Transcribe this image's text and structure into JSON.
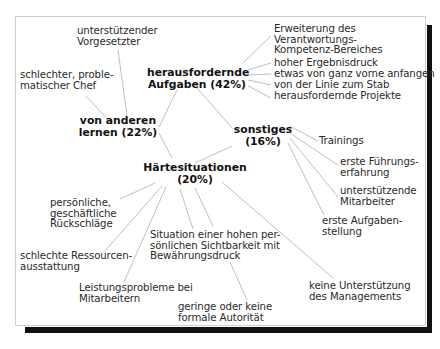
{
  "diagram": {
    "hubs": {
      "learning": "von anderen\nlernen (22%)",
      "challenging": "herausfordernde\nAufgaben (42%)",
      "other": "sonstiges\n(16%)",
      "hardship": "Härtesituationen\n(20%)"
    },
    "learning_items": [
      "unterstützender\nVorgesetzter",
      "schlechter, proble-\nmatischer Chef"
    ],
    "challenging_items": [
      "Erweiterung des\nVerantwortungs-\nKompetenz-Bereiches",
      "hoher Ergebnisdruck",
      "etwas von ganz vorne anfangen",
      "von der Linie zum Stab",
      "herausfordernde Projekte"
    ],
    "other_items": [
      "Trainings",
      "erste Führungs-\nerfahrung",
      "unterstützende\nMitarbeiter",
      "erste Aufgaben-\nstellung"
    ],
    "hardship_items": [
      "persönliche,\ngeschäftliche\nRückschläge",
      "schlechte Ressourcen-\nausstattung",
      "Leistungsprobleme bei\nMitarbeitern",
      "Situation einer hohen per-\nsönlichen Sichtbarkeit mit\nBewährungsdruck",
      "geringe oder keine\nformale Autorität",
      "keine Unterstützung\ndes Managements"
    ]
  }
}
